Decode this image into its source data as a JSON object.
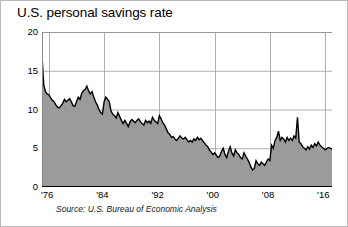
{
  "chart_data": {
    "type": "area",
    "title": "U.S. personal savings rate",
    "subtitle": "",
    "xlabel": "",
    "ylabel": "",
    "source": "Source: U.S. Bureau of Economic Analysis",
    "grid": true,
    "legend": "none",
    "xlim": [
      1975.0,
      2017.0
    ],
    "ylim": [
      0,
      20
    ],
    "yticks": [
      0,
      5,
      10,
      15,
      20
    ],
    "ytick_labels": [
      "0",
      "5",
      "10",
      "15",
      "20"
    ],
    "xticks": [
      1976,
      1984,
      1992,
      2000,
      2008,
      2016
    ],
    "xtick_labels": [
      "'76",
      "'84",
      "'92",
      "'00",
      "'08",
      "'16"
    ],
    "series": [
      {
        "name": "Personal savings rate",
        "units": "percent of disposable personal income",
        "line_color": "#000000",
        "fill_color": "#9b9b9b",
        "x": [
          1975.0,
          1975.25,
          1975.5,
          1975.75,
          1976.0,
          1976.25,
          1976.5,
          1976.75,
          1977.0,
          1977.25,
          1977.5,
          1977.75,
          1978.0,
          1978.25,
          1978.5,
          1978.75,
          1979.0,
          1979.25,
          1979.5,
          1979.75,
          1980.0,
          1980.25,
          1980.5,
          1980.75,
          1981.0,
          1981.25,
          1981.5,
          1981.75,
          1982.0,
          1982.25,
          1982.5,
          1982.75,
          1983.0,
          1983.25,
          1983.5,
          1983.75,
          1984.0,
          1984.25,
          1984.5,
          1984.75,
          1985.0,
          1985.25,
          1985.5,
          1985.75,
          1986.0,
          1986.25,
          1986.5,
          1986.75,
          1987.0,
          1987.25,
          1987.5,
          1987.75,
          1988.0,
          1988.25,
          1988.5,
          1988.75,
          1989.0,
          1989.25,
          1989.5,
          1989.75,
          1990.0,
          1990.25,
          1990.5,
          1990.75,
          1991.0,
          1991.25,
          1991.5,
          1991.75,
          1992.0,
          1992.25,
          1992.5,
          1992.75,
          1993.0,
          1993.25,
          1993.5,
          1993.75,
          1994.0,
          1994.25,
          1994.5,
          1994.75,
          1995.0,
          1995.25,
          1995.5,
          1995.75,
          1996.0,
          1996.25,
          1996.5,
          1996.75,
          1997.0,
          1997.25,
          1997.5,
          1997.75,
          1998.0,
          1998.25,
          1998.5,
          1998.75,
          1999.0,
          1999.25,
          1999.5,
          1999.75,
          2000.0,
          2000.25,
          2000.5,
          2000.75,
          2001.0,
          2001.25,
          2001.5,
          2001.75,
          2002.0,
          2002.25,
          2002.5,
          2002.75,
          2003.0,
          2003.25,
          2003.5,
          2003.75,
          2004.0,
          2004.25,
          2004.5,
          2004.75,
          2005.0,
          2005.25,
          2005.5,
          2005.75,
          2006.0,
          2006.25,
          2006.5,
          2006.75,
          2007.0,
          2007.25,
          2007.5,
          2007.75,
          2008.0,
          2008.25,
          2008.5,
          2008.75,
          2009.0,
          2009.25,
          2009.5,
          2009.75,
          2010.0,
          2010.25,
          2010.5,
          2010.75,
          2011.0,
          2011.25,
          2011.5,
          2011.75,
          2012.0,
          2012.25,
          2012.5,
          2012.75,
          2013.0,
          2013.25,
          2013.5,
          2013.75,
          2014.0,
          2014.25,
          2014.5,
          2014.75,
          2015.0,
          2015.25,
          2015.5,
          2015.75,
          2016.0,
          2016.5,
          2017.0
        ],
        "values": [
          17.0,
          13.2,
          12.3,
          12.0,
          11.9,
          11.5,
          11.2,
          11.0,
          10.6,
          10.3,
          10.2,
          10.5,
          10.8,
          11.3,
          11.0,
          11.2,
          11.4,
          11.0,
          10.5,
          10.4,
          11.0,
          11.6,
          11.3,
          12.1,
          12.4,
          12.6,
          13.0,
          12.4,
          12.0,
          12.3,
          11.6,
          11.0,
          10.6,
          10.0,
          9.6,
          9.4,
          11.0,
          11.6,
          11.3,
          11.0,
          9.8,
          9.4,
          9.2,
          8.9,
          9.6,
          9.1,
          8.6,
          8.2,
          8.6,
          8.2,
          7.8,
          8.4,
          8.7,
          8.5,
          8.3,
          8.6,
          8.8,
          8.4,
          8.2,
          8.0,
          8.6,
          8.3,
          8.5,
          8.2,
          9.0,
          8.6,
          8.4,
          8.2,
          9.2,
          8.8,
          8.3,
          8.0,
          7.5,
          7.0,
          6.8,
          6.4,
          6.5,
          6.2,
          6.0,
          6.3,
          6.6,
          6.3,
          6.2,
          6.4,
          6.1,
          5.8,
          6.0,
          5.8,
          6.2,
          6.0,
          6.4,
          6.1,
          6.3,
          6.0,
          5.7,
          5.4,
          5.2,
          4.8,
          4.5,
          4.2,
          4.4,
          4.1,
          3.8,
          4.0,
          4.6,
          5.0,
          4.2,
          3.8,
          4.6,
          5.2,
          4.4,
          4.0,
          4.8,
          4.4,
          4.2,
          3.8,
          3.6,
          4.4,
          4.0,
          3.6,
          3.2,
          2.6,
          2.2,
          2.4,
          3.4,
          3.0,
          2.8,
          3.2,
          3.0,
          2.8,
          3.2,
          3.6,
          3.4,
          5.4,
          5.0,
          6.0,
          6.4,
          7.2,
          6.0,
          6.4,
          6.2,
          5.8,
          6.4,
          6.0,
          6.3,
          6.0,
          6.6,
          6.3,
          9.0,
          5.8,
          5.6,
          5.2,
          5.0,
          4.8,
          5.2,
          4.9,
          5.4,
          5.1,
          5.6,
          5.3,
          5.8,
          5.4,
          5.2,
          5.0,
          4.8,
          5.1,
          4.9
        ]
      }
    ]
  }
}
